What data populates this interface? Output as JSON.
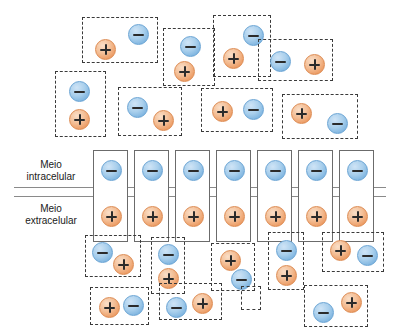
{
  "figure": {
    "type": "diagram",
    "background_color": "#ffffff",
    "width": 400,
    "height": 336
  },
  "colors": {
    "negative_ion_fill": "#a9cfec",
    "negative_ion_stroke": "#6aa4d4",
    "positive_ion_fill": "#f3bd94",
    "positive_ion_stroke": "#dd8b52",
    "glyph": "#2b2b2b",
    "dashed_box_stroke": "#3a3a3a",
    "solid_box_stroke": "#6b6b6b",
    "membrane_line": "#8a8a8a"
  },
  "ion_symbols": {
    "negative": "minus-ion",
    "positive": "plus-ion"
  },
  "membrane": {
    "labels": {
      "intracellular": "Meio\nintracelular",
      "intracellular_line1": "Meio",
      "intracellular_line2": "intracelular",
      "extracellular_line1": "Meio",
      "extracellular_line2": "extracelular"
    },
    "lines": [
      {
        "name": "membrane-line-upper",
        "y": 187
      },
      {
        "name": "membrane-line-lower",
        "y": 196
      }
    ],
    "channels": [
      {
        "x": 93,
        "y": 150,
        "w": 35,
        "h": 92,
        "neg": {
          "x": 7,
          "y": 9
        },
        "pos": {
          "x": 7,
          "y": 55
        }
      },
      {
        "x": 134,
        "y": 150,
        "w": 35,
        "h": 92,
        "neg": {
          "x": 7,
          "y": 9
        },
        "pos": {
          "x": 7,
          "y": 55
        }
      },
      {
        "x": 175,
        "y": 150,
        "w": 35,
        "h": 92,
        "neg": {
          "x": 7,
          "y": 9
        },
        "pos": {
          "x": 7,
          "y": 55
        }
      },
      {
        "x": 216,
        "y": 150,
        "w": 35,
        "h": 92,
        "neg": {
          "x": 7,
          "y": 9
        },
        "pos": {
          "x": 7,
          "y": 55
        }
      },
      {
        "x": 257,
        "y": 150,
        "w": 35,
        "h": 92,
        "neg": {
          "x": 7,
          "y": 9
        },
        "pos": {
          "x": 7,
          "y": 55
        }
      },
      {
        "x": 298,
        "y": 150,
        "w": 35,
        "h": 92,
        "neg": {
          "x": 7,
          "y": 9
        },
        "pos": {
          "x": 7,
          "y": 55
        }
      },
      {
        "x": 339,
        "y": 150,
        "w": 35,
        "h": 92,
        "neg": {
          "x": 7,
          "y": 9
        },
        "pos": {
          "x": 7,
          "y": 55
        }
      }
    ]
  },
  "dipoles_top": [
    {
      "id": "top-1",
      "x": 82,
      "y": 17,
      "w": 76,
      "h": 46,
      "ions": [
        {
          "sign": "negative",
          "x": 45,
          "y": 6
        },
        {
          "sign": "positive",
          "x": 12,
          "y": 21
        }
      ]
    },
    {
      "id": "top-2",
      "x": 55,
      "y": 71,
      "w": 51,
      "h": 66,
      "ions": [
        {
          "sign": "negative",
          "x": 13,
          "y": 9
        },
        {
          "sign": "positive",
          "x": 13,
          "y": 37
        }
      ]
    },
    {
      "id": "top-3",
      "x": 118,
      "y": 87,
      "w": 64,
      "h": 49,
      "ions": [
        {
          "sign": "negative",
          "x": 8,
          "y": 9
        },
        {
          "sign": "positive",
          "x": 34,
          "y": 22
        }
      ]
    },
    {
      "id": "top-4",
      "x": 163,
      "y": 28,
      "w": 52,
      "h": 58,
      "ions": [
        {
          "sign": "negative",
          "x": 16,
          "y": 7
        },
        {
          "sign": "positive",
          "x": 10,
          "y": 32
        }
      ]
    },
    {
      "id": "top-5",
      "x": 213,
      "y": 15,
      "w": 58,
      "h": 62,
      "ions": [
        {
          "sign": "negative",
          "x": 29,
          "y": 9
        },
        {
          "sign": "positive",
          "x": 9,
          "y": 32
        }
      ]
    },
    {
      "id": "top-6",
      "x": 258,
      "y": 39,
      "w": 75,
      "h": 42,
      "ions": [
        {
          "sign": "negative",
          "x": 11,
          "y": 11
        },
        {
          "sign": "positive",
          "x": 45,
          "y": 14
        }
      ]
    },
    {
      "id": "top-7",
      "x": 201,
      "y": 88,
      "w": 72,
      "h": 44,
      "ions": [
        {
          "sign": "positive",
          "x": 10,
          "y": 12
        },
        {
          "sign": "negative",
          "x": 41,
          "y": 10
        }
      ]
    },
    {
      "id": "top-8",
      "x": 282,
      "y": 94,
      "w": 76,
      "h": 45,
      "ions": [
        {
          "sign": "positive",
          "x": 8,
          "y": 8
        },
        {
          "sign": "negative",
          "x": 44,
          "y": 18
        }
      ]
    },
    {
      "id": "top-9",
      "x": 135,
      "y": 82,
      "w": 0,
      "h": 0,
      "ions": []
    }
  ],
  "dipoles_bottom": [
    {
      "id": "bot-1",
      "x": 85,
      "y": 235,
      "w": 56,
      "h": 42,
      "ions": [
        {
          "sign": "negative",
          "x": 6,
          "y": 6
        },
        {
          "sign": "positive",
          "x": 27,
          "y": 18
        }
      ]
    },
    {
      "id": "bot-2",
      "x": 151,
      "y": 237,
      "w": 34,
      "h": 57,
      "ions": [
        {
          "sign": "negative",
          "x": 6,
          "y": 6
        },
        {
          "sign": "positive",
          "x": 6,
          "y": 30
        }
      ]
    },
    {
      "id": "bot-3",
      "x": 211,
      "y": 243,
      "w": 44,
      "h": 48,
      "ions": [
        {
          "sign": "positive",
          "x": 8,
          "y": 6
        },
        {
          "sign": "negative",
          "x": 19,
          "y": 25
        }
      ]
    },
    {
      "id": "bot-4",
      "x": 268,
      "y": 232,
      "w": 36,
      "h": 58,
      "ions": [
        {
          "sign": "negative",
          "x": 7,
          "y": 7
        },
        {
          "sign": "positive",
          "x": 7,
          "y": 32
        }
      ]
    },
    {
      "id": "bot-5",
      "x": 322,
      "y": 232,
      "w": 62,
      "h": 40,
      "ions": [
        {
          "sign": "positive",
          "x": 7,
          "y": 7
        },
        {
          "sign": "negative",
          "x": 34,
          "y": 12
        }
      ]
    },
    {
      "id": "bot-6",
      "x": 90,
      "y": 287,
      "w": 59,
      "h": 38,
      "ions": [
        {
          "sign": "positive",
          "x": 8,
          "y": 9
        },
        {
          "sign": "negative",
          "x": 32,
          "y": 7
        }
      ]
    },
    {
      "id": "bot-7",
      "x": 159,
      "y": 283,
      "w": 63,
      "h": 37,
      "ions": [
        {
          "sign": "negative",
          "x": 6,
          "y": 13
        },
        {
          "sign": "positive",
          "x": 32,
          "y": 9
        }
      ]
    },
    {
      "id": "bot-8",
      "x": 241,
      "y": 286,
      "w": 20,
      "h": 24,
      "ions": []
    },
    {
      "id": "bot-9",
      "x": 304,
      "y": 285,
      "w": 64,
      "h": 42,
      "ions": [
        {
          "sign": "negative",
          "x": 8,
          "y": 16
        },
        {
          "sign": "positive",
          "x": 36,
          "y": 6
        }
      ]
    }
  ]
}
